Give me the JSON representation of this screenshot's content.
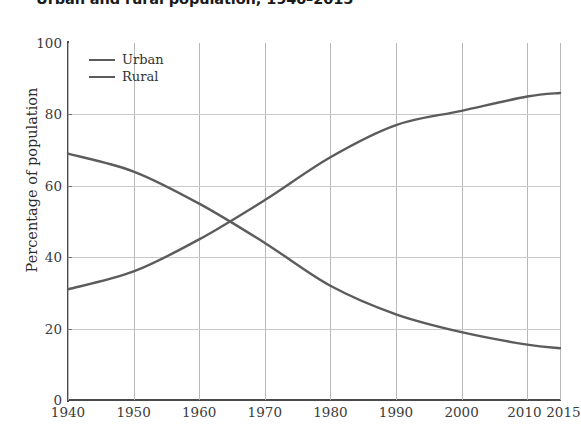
{
  "chart_data": {
    "type": "line",
    "title": "Urban and rural population, 1940–2015",
    "xlabel": "",
    "ylabel": "Percentage of population",
    "grid": true,
    "legend_position": "top-left",
    "xlim": [
      1940,
      2015
    ],
    "ylim": [
      0,
      100
    ],
    "x": [
      1940,
      1950,
      1960,
      1970,
      1980,
      1990,
      2000,
      2010,
      2015
    ],
    "xticks": [
      "1940",
      "1950",
      "1960",
      "1970",
      "1980",
      "1990",
      "2000",
      "2010",
      "2015"
    ],
    "yticks": [
      "0",
      "20",
      "40",
      "60",
      "80",
      "100"
    ],
    "ytick_values": [
      0,
      20,
      40,
      60,
      80,
      100
    ],
    "series": [
      {
        "name": "Urban",
        "color": "#5c5c5c",
        "values": [
          31,
          36,
          45,
          56,
          68,
          77,
          81,
          85,
          86
        ]
      },
      {
        "name": "Rural",
        "color": "#5c5c5c",
        "values": [
          69,
          64,
          55,
          44,
          32,
          24,
          19,
          15.5,
          14.5
        ]
      }
    ]
  },
  "legend": {
    "items": [
      {
        "label": "Urban"
      },
      {
        "label": "Rural"
      }
    ]
  }
}
